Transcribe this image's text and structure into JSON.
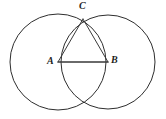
{
  "diagram": {
    "background_color": "#ffffff",
    "stroke_color": "#2e2e2e",
    "label_color": "#1d1d1d",
    "canvas": {
      "width": 166,
      "height": 119
    },
    "circles": [
      {
        "name": "circle-centered-at-A",
        "center_label": "A",
        "cx": 58,
        "cy": 62,
        "r": 48
      },
      {
        "name": "circle-centered-at-B",
        "center_label": "B",
        "cx": 108,
        "cy": 62,
        "r": 47
      }
    ],
    "points": [
      {
        "id": "A",
        "label": "A",
        "x": 58,
        "y": 62,
        "role": "left-circle-center"
      },
      {
        "id": "B",
        "label": "B",
        "x": 108,
        "y": 62,
        "role": "right-circle-center"
      },
      {
        "id": "C",
        "label": "C",
        "x": 83,
        "y": 19,
        "role": "upper-intersection"
      }
    ],
    "segments": [
      {
        "name": "segment-AC",
        "from": "A",
        "to": "C"
      },
      {
        "name": "segment-BC",
        "from": "B",
        "to": "C"
      },
      {
        "name": "segment-AB",
        "from": "A",
        "to": "B"
      }
    ],
    "labels": {
      "a": "A",
      "b": "B",
      "c": "C"
    }
  }
}
